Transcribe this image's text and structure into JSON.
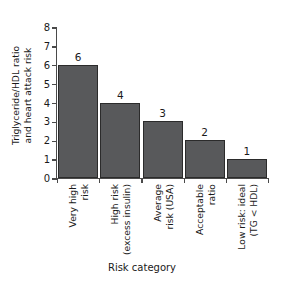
{
  "chart_data": {
    "type": "bar",
    "title": "",
    "xlabel": "Risk category",
    "ylabel": "Triglyceride/HDL ratio and heart attack risk",
    "ylabel_lines": [
      "Triglyceride/HDL ratio",
      "and heart attack risk"
    ],
    "categories": [
      "Very high risk",
      "High risk (excess insulin)",
      "Average risk (USA)",
      "Acceptable ratio",
      "Low risk: ideal (TG < HDL)"
    ],
    "category_lines": [
      [
        "Very high",
        "risk"
      ],
      [
        "High risk",
        "(excess insulin)"
      ],
      [
        "Average",
        "risk (USA)"
      ],
      [
        "Acceptable",
        "ratio"
      ],
      [
        "Low risk: ideal",
        "(TG < HDL)"
      ]
    ],
    "values": [
      6,
      4,
      3,
      2,
      1
    ],
    "value_labels": [
      "6",
      "4",
      "3",
      "2",
      "1"
    ],
    "ylim": [
      0,
      8
    ],
    "yticks": [
      0,
      1,
      2,
      3,
      4,
      5,
      6,
      7,
      8
    ],
    "ytick_labels": [
      "0",
      "1",
      "2",
      "3",
      "4",
      "5",
      "6",
      "7",
      "8"
    ],
    "grid": false,
    "legend": null,
    "bar_color": "#58595b",
    "bar_edge_color": "#2b2b2b",
    "axis_color": "#4a4a4a",
    "background_color": "#ffffff"
  }
}
